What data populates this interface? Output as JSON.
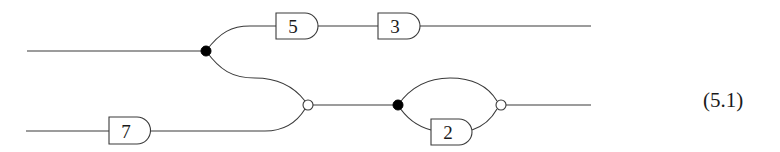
{
  "diagram": {
    "equation_label": "(5.1)",
    "colors": {
      "stroke": "#3a3a3a",
      "filled_node": "#000000",
      "open_node": "#ffffff"
    },
    "gates": [
      {
        "id": "gate-5",
        "label": "5"
      },
      {
        "id": "gate-3",
        "label": "3"
      },
      {
        "id": "gate-7",
        "label": "7"
      },
      {
        "id": "gate-2",
        "label": "2"
      }
    ],
    "nodes": [
      {
        "id": "split-top",
        "type": "filled"
      },
      {
        "id": "merge-middle",
        "type": "open"
      },
      {
        "id": "split-right",
        "type": "filled"
      },
      {
        "id": "merge-right",
        "type": "open"
      }
    ]
  }
}
